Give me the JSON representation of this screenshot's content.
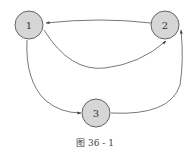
{
  "diagram": {
    "type": "directed-graph",
    "caption": "图 36 - 1",
    "nodes": [
      {
        "id": "1",
        "label": "1"
      },
      {
        "id": "2",
        "label": "2"
      },
      {
        "id": "3",
        "label": "3"
      }
    ],
    "edges": [
      {
        "from": "2",
        "to": "1"
      },
      {
        "from": "1",
        "to": "2"
      },
      {
        "from": "1",
        "to": "3"
      },
      {
        "from": "3",
        "to": "2"
      }
    ],
    "colors": {
      "node_fill": "#d6d6d6",
      "stroke": "#555555",
      "text": "#333333"
    }
  }
}
